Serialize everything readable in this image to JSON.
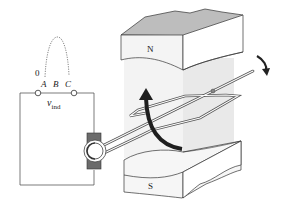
{
  "diagram": {
    "waveform_labels": {
      "zero": "0",
      "a": "A",
      "b": "B",
      "c": "C"
    },
    "voltage_label": {
      "symbol": "v",
      "subscript": "ind"
    },
    "poles": {
      "north": "N",
      "south": "S"
    },
    "colors": {
      "line": "#333333",
      "pole_face": "#f2f2f2",
      "pole_top": "#b5b5b5",
      "field_shade": "#ececec",
      "brush": "#6a6a6a",
      "arrow": "#222222"
    }
  }
}
